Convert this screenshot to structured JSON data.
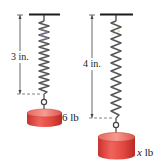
{
  "figure": {
    "colors": {
      "ceiling": "#1a1a1a",
      "spring": "#5a5a5a",
      "spring_highlight": "#8a8ab8",
      "weight_body": "#e04a45",
      "weight_top": "#f07a6e",
      "dimension_line": "#444444"
    },
    "left_spring": {
      "stretch_label": "3 in.",
      "weight_label": "6 lb"
    },
    "right_spring": {
      "stretch_label": "4 in.",
      "weight_var": "x",
      "weight_unit": " lb"
    }
  }
}
